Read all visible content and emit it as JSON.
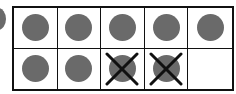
{
  "ten_frame": {
    "rows": 2,
    "columns": 5,
    "dot_color": "#6a6a6a",
    "line_color": "#111111",
    "cells": [
      {
        "dot": true,
        "crossed": false
      },
      {
        "dot": true,
        "crossed": false
      },
      {
        "dot": true,
        "crossed": false
      },
      {
        "dot": true,
        "crossed": false
      },
      {
        "dot": true,
        "crossed": false
      },
      {
        "dot": true,
        "crossed": false
      },
      {
        "dot": true,
        "crossed": false
      },
      {
        "dot": true,
        "crossed": true
      },
      {
        "dot": true,
        "crossed": true
      },
      {
        "dot": false,
        "crossed": false
      }
    ],
    "total_dots": 9,
    "crossed_out": 2,
    "remaining": 7
  }
}
